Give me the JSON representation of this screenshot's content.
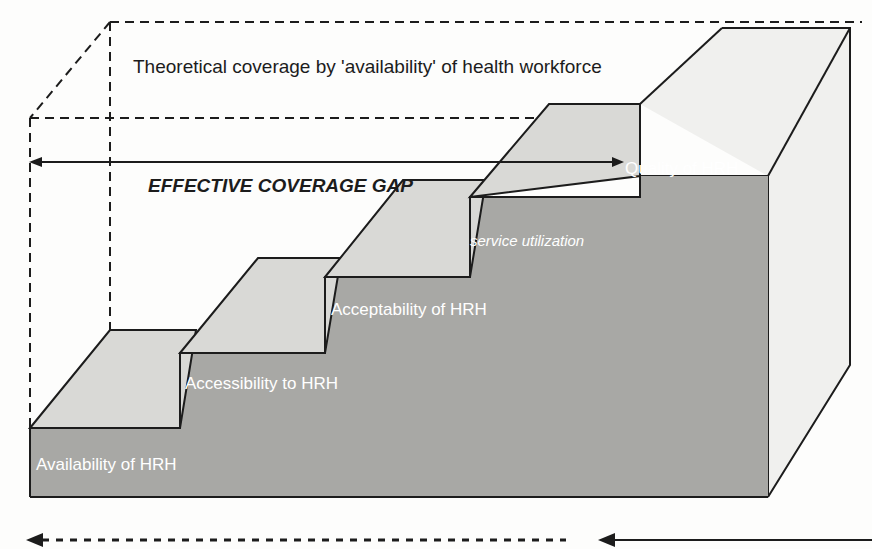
{
  "figure": {
    "title_text": "Theoretical coverage by 'availability' of health workforce",
    "gap_label": "EFFECTIVE COVERAGE GAP",
    "service_label": "service utilization",
    "background_color": "#fdfdfc",
    "outline_color": "#1c1c1c",
    "top_face_color": "#d9d9d6",
    "front_face_color": "#a8a8a5",
    "box_face_color": "#f0f0ee"
  },
  "steps": [
    {
      "id": "step-1",
      "label": "Availability of HRH",
      "label_x": 36,
      "label_y": 470,
      "label_color": "#ffffff"
    },
    {
      "id": "step-2",
      "label": "Accessibility to HRH",
      "label_x": 185,
      "label_y": 389,
      "label_color": "#ffffff"
    },
    {
      "id": "step-3",
      "label": "Acceptability of HRH",
      "label_x": 331,
      "label_y": 315,
      "label_color": "#ffffff"
    },
    {
      "id": "step-4",
      "label": "Quality of HRH",
      "label_x": 625,
      "label_y": 174,
      "label_color": "#ffffff"
    }
  ],
  "arrows": {
    "coverage_gap": {
      "name": "effective-coverage-gap-arrow",
      "style": "solid",
      "direction": "bidirectional",
      "x1": 30,
      "x2": 622,
      "y": 162
    },
    "bottom_dashed": {
      "name": "bottom-dashed-arrow",
      "style": "dashed",
      "direction": "left",
      "x1": 28,
      "x2": 566,
      "y": 540
    },
    "bottom_solid": {
      "name": "bottom-solid-arrow",
      "style": "solid",
      "direction": "left",
      "x1": 600,
      "x2": 872,
      "y": 540
    }
  }
}
